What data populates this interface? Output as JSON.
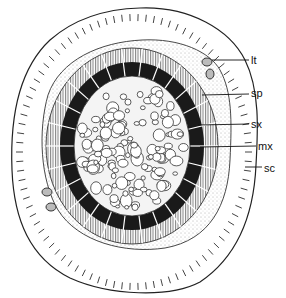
{
  "figure": {
    "type": "botanical cross-section diagram",
    "labels": [
      {
        "id": "lt",
        "text": "lt",
        "x": 251,
        "y": 55,
        "line_from": [
          212,
          60
        ],
        "line_to": [
          249,
          60
        ]
      },
      {
        "id": "sp",
        "text": "sp",
        "x": 251,
        "y": 88,
        "line_from": [
          202,
          95
        ],
        "line_to": [
          249,
          94
        ]
      },
      {
        "id": "sx",
        "text": "sx",
        "x": 251,
        "y": 119,
        "line_from": [
          198,
          125
        ],
        "line_to": [
          249,
          124
        ]
      },
      {
        "id": "mx",
        "text": "mx",
        "x": 258,
        "y": 141,
        "line_from": [
          200,
          147
        ],
        "line_to": [
          256,
          146
        ]
      },
      {
        "id": "sc",
        "text": "sc",
        "x": 264,
        "y": 163,
        "line_from": [
          245,
          167
        ],
        "line_to": [
          262,
          167
        ]
      }
    ],
    "colors": {
      "ink": "#111111",
      "sclerenchyma": "#1a1a1a",
      "stipple": "#e8e8e8",
      "background": "#ffffff"
    }
  }
}
